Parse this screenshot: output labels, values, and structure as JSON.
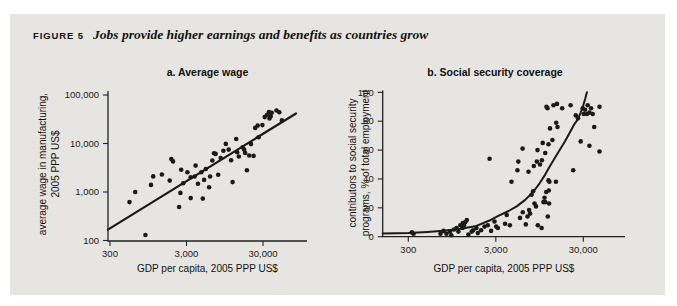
{
  "figure": {
    "label": "FIGURE 5",
    "title": "Jobs provide higher earnings and benefits as countries grow"
  },
  "colors": {
    "panel_bg": "#e6e5e1",
    "ink": "#1a1a1a",
    "axis": "#222222"
  },
  "chart_data": [
    {
      "id": "a",
      "type": "scatter",
      "title": "a. Average wage",
      "xlabel": "GDP per capita, 2005 PPP US$",
      "ylabel_line1": "average wage in manufacturing,",
      "ylabel_line2": "2005 PPP US$",
      "x_scale": "log",
      "y_scale": "log",
      "xlim": [
        300,
        80000
      ],
      "ylim": [
        100,
        100000
      ],
      "grid": false,
      "legend": "none",
      "x_ticks": [
        {
          "v": 300,
          "label": "300"
        },
        {
          "v": 3000,
          "label": "3,000"
        },
        {
          "v": 30000,
          "label": "30,000"
        }
      ],
      "y_ticks": [
        {
          "v": 100,
          "label": "100"
        },
        {
          "v": 1000,
          "label": "1,000"
        },
        {
          "v": 10000,
          "label": "10,000"
        },
        {
          "v": 100000,
          "label": "100,000"
        }
      ],
      "points": [
        [
          540,
          620
        ],
        [
          640,
          1000
        ],
        [
          870,
          130
        ],
        [
          1030,
          1400
        ],
        [
          1100,
          2100
        ],
        [
          1430,
          2290
        ],
        [
          1810,
          1720
        ],
        [
          1900,
          4800
        ],
        [
          2000,
          4270
        ],
        [
          2400,
          490
        ],
        [
          2500,
          960
        ],
        [
          2560,
          2870
        ],
        [
          2720,
          1520
        ],
        [
          3080,
          2560
        ],
        [
          3400,
          750
        ],
        [
          3400,
          2010
        ],
        [
          3830,
          2090
        ],
        [
          3940,
          3510
        ],
        [
          4240,
          1480
        ],
        [
          4690,
          2560
        ],
        [
          4900,
          730
        ],
        [
          5100,
          1780
        ],
        [
          5370,
          2980
        ],
        [
          5920,
          1250
        ],
        [
          6100,
          2090
        ],
        [
          6530,
          4470
        ],
        [
          6860,
          6310
        ],
        [
          7200,
          6100
        ],
        [
          7800,
          2260
        ],
        [
          8400,
          5000
        ],
        [
          9100,
          7100
        ],
        [
          9800,
          9800
        ],
        [
          10700,
          7500
        ],
        [
          11500,
          4500
        ],
        [
          12000,
          1600
        ],
        [
          13400,
          12400
        ],
        [
          13800,
          6600
        ],
        [
          14500,
          5400
        ],
        [
          16300,
          8400
        ],
        [
          17000,
          7500
        ],
        [
          17500,
          6400
        ],
        [
          18500,
          2800
        ],
        [
          19800,
          5660
        ],
        [
          20900,
          9700
        ],
        [
          22600,
          5560
        ],
        [
          23700,
          21000
        ],
        [
          25600,
          23400
        ],
        [
          26300,
          13500
        ],
        [
          29500,
          24000
        ],
        [
          31600,
          35000
        ],
        [
          33900,
          39000
        ],
        [
          35800,
          44400
        ],
        [
          36500,
          33000
        ],
        [
          37800,
          36500
        ],
        [
          39000,
          43000
        ],
        [
          45000,
          47800
        ],
        [
          49000,
          44200
        ],
        [
          53000,
          30000
        ]
      ],
      "trend_line": {
        "x1": 282,
        "y1": 168,
        "x2": 81000,
        "y2": 41600
      }
    },
    {
      "id": "b",
      "type": "scatter",
      "title": "b. Social security coverage",
      "xlabel": "GDP per capita, 2005 PPP US$",
      "ylabel_line1": "contributors to social security",
      "ylabel_line2": "programs, % of total employment",
      "x_scale": "log",
      "y_scale": "linear",
      "xlim": [
        300,
        60000
      ],
      "ylim": [
        0,
        100
      ],
      "grid": false,
      "legend": "none",
      "x_ticks": [
        {
          "v": 300,
          "label": "300"
        },
        {
          "v": 3000,
          "label": "3,000"
        },
        {
          "v": 30000,
          "label": "30,000"
        }
      ],
      "y_ticks": [
        {
          "v": 0,
          "label": "0"
        },
        {
          "v": 20,
          "label": "20"
        },
        {
          "v": 40,
          "label": "40"
        },
        {
          "v": 60,
          "label": "60"
        },
        {
          "v": 80,
          "label": "80"
        },
        {
          "v": 100,
          "label": "100"
        }
      ],
      "points": [
        [
          330,
          3
        ],
        [
          345,
          2
        ],
        [
          700,
          2
        ],
        [
          760,
          4
        ],
        [
          820,
          2
        ],
        [
          900,
          3.5
        ],
        [
          930,
          1
        ],
        [
          1000,
          5
        ],
        [
          1070,
          6
        ],
        [
          1120,
          3.5
        ],
        [
          1180,
          8
        ],
        [
          1250,
          6
        ],
        [
          1260,
          9.5
        ],
        [
          1300,
          8
        ],
        [
          1340,
          10
        ],
        [
          1400,
          11.5
        ],
        [
          1460,
          1.5
        ],
        [
          1590,
          3.5
        ],
        [
          1650,
          4.5
        ],
        [
          1800,
          6
        ],
        [
          1870,
          2.5
        ],
        [
          2040,
          4.5
        ],
        [
          2230,
          7
        ],
        [
          2430,
          8
        ],
        [
          2650,
          4
        ],
        [
          2900,
          10.5
        ],
        [
          3030,
          7
        ],
        [
          3170,
          6
        ],
        [
          3830,
          9
        ],
        [
          4000,
          15
        ],
        [
          4350,
          8
        ],
        [
          4530,
          38
        ],
        [
          2550,
          54
        ],
        [
          5430,
          52
        ],
        [
          5290,
          46
        ],
        [
          5670,
          13
        ],
        [
          6080,
          61
        ],
        [
          6100,
          17
        ],
        [
          6600,
          8.5
        ],
        [
          6900,
          14
        ],
        [
          7100,
          45
        ],
        [
          7200,
          18.5
        ],
        [
          7400,
          16
        ],
        [
          7700,
          29
        ],
        [
          8000,
          31.5
        ],
        [
          8150,
          49
        ],
        [
          8300,
          23
        ],
        [
          8650,
          21
        ],
        [
          8830,
          52
        ],
        [
          9050,
          8
        ],
        [
          9000,
          60
        ],
        [
          9600,
          50
        ],
        [
          10100,
          53
        ],
        [
          10000,
          6
        ],
        [
          10500,
          24
        ],
        [
          10800,
          27
        ],
        [
          11300,
          31
        ],
        [
          11800,
          14
        ],
        [
          12300,
          38
        ],
        [
          10300,
          65
        ],
        [
          11000,
          58
        ],
        [
          12000,
          64
        ],
        [
          12500,
          75
        ],
        [
          13300,
          67
        ],
        [
          11400,
          90
        ],
        [
          11700,
          89
        ],
        [
          13700,
          91
        ],
        [
          15200,
          76
        ],
        [
          15000,
          92
        ],
        [
          17200,
          89
        ],
        [
          21500,
          91
        ],
        [
          14700,
          79
        ],
        [
          12000,
          39
        ],
        [
          14600,
          38
        ],
        [
          12100,
          32
        ],
        [
          11000,
          24
        ],
        [
          12200,
          23
        ],
        [
          23000,
          46
        ],
        [
          24600,
          84
        ],
        [
          26100,
          82
        ],
        [
          29500,
          89
        ],
        [
          30400,
          85
        ],
        [
          31400,
          88
        ],
        [
          33100,
          85
        ],
        [
          33700,
          91
        ],
        [
          35200,
          86
        ],
        [
          36800,
          89
        ],
        [
          38400,
          85
        ],
        [
          46000,
          90
        ],
        [
          40000,
          76
        ],
        [
          28000,
          66
        ],
        [
          35200,
          63
        ],
        [
          46000,
          59
        ]
      ],
      "fit_curve": [
        [
          153,
          2.2
        ],
        [
          300,
          2.6
        ],
        [
          500,
          3.3
        ],
        [
          800,
          4.2
        ],
        [
          1200,
          5.5
        ],
        [
          1800,
          7.5
        ],
        [
          2500,
          11
        ],
        [
          3200,
          14.5
        ],
        [
          4200,
          17.8
        ],
        [
          5200,
          21
        ],
        [
          6500,
          25.5
        ],
        [
          8000,
          31
        ],
        [
          9500,
          37
        ],
        [
          11000,
          43
        ],
        [
          12500,
          49
        ],
        [
          14500,
          55.5
        ],
        [
          16500,
          61
        ],
        [
          18500,
          66
        ],
        [
          21000,
          72
        ],
        [
          23500,
          77.5
        ],
        [
          26000,
          81.5
        ],
        [
          28000,
          86
        ],
        [
          30000,
          91
        ],
        [
          31500,
          95.5
        ],
        [
          33000,
          100
        ]
      ]
    }
  ]
}
